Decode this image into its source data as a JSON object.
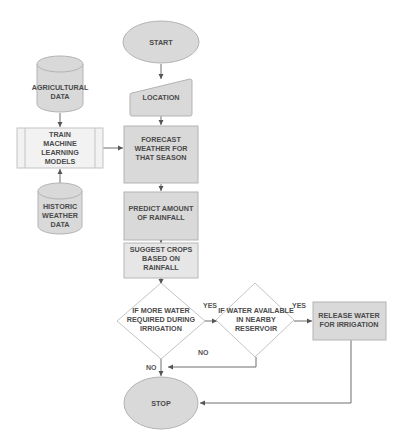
{
  "diagram": {
    "type": "flowchart",
    "nodes": {
      "start": {
        "label": "START",
        "shape": "ellipse"
      },
      "location": {
        "label": "LOCATION",
        "shape": "manual-input"
      },
      "forecast": {
        "lines": [
          "FORECAST",
          "WEATHER FOR",
          "THAT SEASON"
        ],
        "shape": "process"
      },
      "predict": {
        "lines": [
          "PREDICT AMOUNT",
          "OF RAINFALL"
        ],
        "shape": "process"
      },
      "suggest": {
        "lines": [
          "SUGGEST CROPS",
          "BASED ON",
          "RAINFALL"
        ],
        "shape": "process"
      },
      "decision_more_water": {
        "lines": [
          "IF MORE WATER",
          "REQUIRED DURING",
          "IRRIGATION"
        ],
        "shape": "decision"
      },
      "decision_reservoir": {
        "lines": [
          "IF WATER AVAILABLE",
          "IN NEARBY",
          "RESERVOIR"
        ],
        "shape": "decision"
      },
      "release": {
        "lines": [
          "RELEASE WATER",
          "FOR IRRIGATION"
        ],
        "shape": "process"
      },
      "stop": {
        "label": "STOP",
        "shape": "ellipse"
      },
      "agri_data": {
        "lines": [
          "AGRICULTURAL",
          "DATA"
        ],
        "shape": "database"
      },
      "train": {
        "lines": [
          "TRAIN",
          "MACHINE",
          "LEARNING",
          "MODELS"
        ],
        "shape": "predefined-process"
      },
      "historic_data": {
        "lines": [
          "HISTORIC",
          "WEATHER",
          "DATA"
        ],
        "shape": "database"
      }
    },
    "edge_labels": {
      "yes_1": "YES",
      "yes_2": "YES",
      "no_1": "NO",
      "no_2": "NO"
    },
    "edges": [
      {
        "from": "start",
        "to": "location"
      },
      {
        "from": "location",
        "to": "forecast"
      },
      {
        "from": "agri_data",
        "to": "train"
      },
      {
        "from": "historic_data",
        "to": "train"
      },
      {
        "from": "train",
        "to": "forecast"
      },
      {
        "from": "forecast",
        "to": "predict"
      },
      {
        "from": "predict",
        "to": "suggest"
      },
      {
        "from": "suggest",
        "to": "decision_more_water"
      },
      {
        "from": "decision_more_water",
        "to": "decision_reservoir",
        "label": "YES"
      },
      {
        "from": "decision_reservoir",
        "to": "release",
        "label": "YES"
      },
      {
        "from": "decision_reservoir",
        "to": "stop",
        "label": "NO"
      },
      {
        "from": "decision_more_water",
        "to": "stop",
        "label": "NO"
      },
      {
        "from": "release",
        "to": "stop"
      }
    ],
    "colors": {
      "node_fill": "#d9d9d9",
      "node_stroke": "#b3b3b3",
      "decision_fill": "#ffffff",
      "text": "#4a4a4a",
      "connector": "#6e6e6e"
    }
  }
}
